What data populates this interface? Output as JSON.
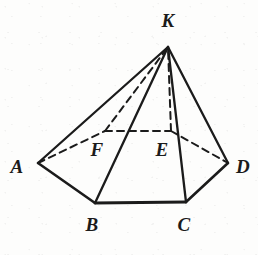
{
  "figure": {
    "kind": "geometry-diagram",
    "background_color": "#fdfdfc",
    "ink_color": "#1b1b1b",
    "canvas": {
      "width": 258,
      "height": 255
    }
  },
  "vertices": [
    {
      "id": "K",
      "label": "K",
      "name": "apex",
      "x": 168,
      "y": 47,
      "label_x": 168,
      "label_y": 20
    },
    {
      "id": "A",
      "label": "A",
      "name": "base-front-left",
      "x": 38,
      "y": 163,
      "label_x": 17,
      "label_y": 166
    },
    {
      "id": "B",
      "label": "B",
      "name": "base-front-bottom-left",
      "x": 95,
      "y": 203,
      "label_x": 92,
      "label_y": 224
    },
    {
      "id": "C",
      "label": "C",
      "name": "base-front-bottom-right",
      "x": 186,
      "y": 202,
      "label_x": 184,
      "label_y": 224
    },
    {
      "id": "D",
      "label": "D",
      "name": "base-front-right",
      "x": 228,
      "y": 163,
      "label_x": 243,
      "label_y": 166
    },
    {
      "id": "F",
      "label": "F",
      "name": "base-back-left",
      "x": 105,
      "y": 131,
      "label_x": 97,
      "label_y": 149
    },
    {
      "id": "E",
      "label": "E",
      "name": "base-back-right",
      "x": 171,
      "y": 131,
      "label_x": 162,
      "label_y": 149
    }
  ],
  "edges": [
    {
      "id": "A-K",
      "from": "A",
      "to": "K",
      "style": "solid",
      "width": 2.3,
      "name": "edge-a-k"
    },
    {
      "id": "B-K",
      "from": "B",
      "to": "K",
      "style": "solid",
      "width": 2.3,
      "name": "edge-b-k"
    },
    {
      "id": "C-K",
      "from": "C",
      "to": "K",
      "style": "solid",
      "width": 2.3,
      "name": "edge-c-k"
    },
    {
      "id": "D-K",
      "from": "D",
      "to": "K",
      "style": "solid",
      "width": 2.3,
      "name": "edge-d-k"
    },
    {
      "id": "A-B",
      "from": "A",
      "to": "B",
      "style": "solid",
      "width": 2.6,
      "name": "edge-a-b"
    },
    {
      "id": "B-C",
      "from": "B",
      "to": "C",
      "style": "solid",
      "width": 2.8,
      "name": "edge-b-c"
    },
    {
      "id": "C-D",
      "from": "C",
      "to": "D",
      "style": "solid",
      "width": 2.6,
      "name": "edge-c-d"
    },
    {
      "id": "F-K",
      "from": "F",
      "to": "K",
      "style": "dashed",
      "width": 2.0,
      "name": "hidden-edge-f-k"
    },
    {
      "id": "E-K",
      "from": "E",
      "to": "K",
      "style": "dashed",
      "width": 2.0,
      "name": "hidden-edge-e-k"
    },
    {
      "id": "A-F",
      "from": "A",
      "to": "F",
      "style": "dashed",
      "width": 2.0,
      "name": "hidden-edge-a-f"
    },
    {
      "id": "F-E",
      "from": "F",
      "to": "E",
      "style": "dashed",
      "width": 2.0,
      "name": "hidden-edge-f-e"
    },
    {
      "id": "E-D",
      "from": "E",
      "to": "D",
      "style": "dashed",
      "width": 2.0,
      "name": "hidden-edge-e-d"
    }
  ]
}
